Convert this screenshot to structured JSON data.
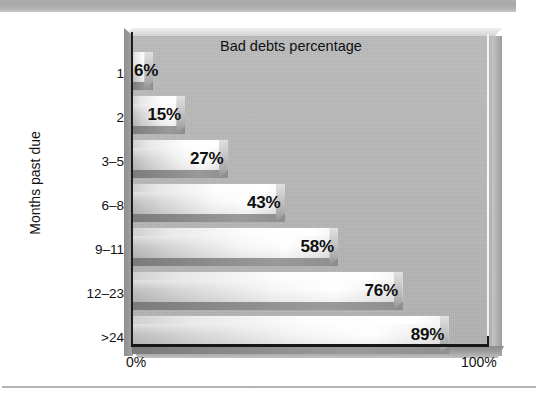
{
  "figure": {
    "title": "Bad debts percentage",
    "y_axis_title": "Months past due",
    "x_min_label": "0%",
    "x_max_label": "100%"
  },
  "colors": {
    "panel_background": "#b7b7b7",
    "bar_highlight": "#ffffff",
    "bar_shadow": "#8b8b8b",
    "axis": "#161616",
    "gridline_100": "#f7f7f7",
    "text": "#101010",
    "top_rule": "#adadad",
    "bottom_rule": "#9a9a9a"
  },
  "chart_data": {
    "type": "bar",
    "orientation": "horizontal",
    "title": "Bad debts percentage",
    "xlabel": "",
    "ylabel": "Months past due",
    "xlim": [
      0,
      100
    ],
    "grid": false,
    "legend": "none",
    "xtick_labels": [
      "0%",
      "100%"
    ],
    "categories": [
      "1",
      "2",
      "3–5",
      "6–8",
      "9–11",
      "12–23",
      ">24"
    ],
    "values": [
      6,
      15,
      27,
      43,
      58,
      76,
      89
    ],
    "data_labels": [
      "6%",
      "15%",
      "27%",
      "43%",
      "58%",
      "76%",
      "89%"
    ]
  }
}
